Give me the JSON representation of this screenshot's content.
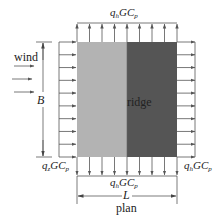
{
  "figure": {
    "type": "diagram",
    "title": "plan",
    "colors": {
      "windward_half": "#b3b3b3",
      "leeward_half": "#555555",
      "arrows": "#555555",
      "text": "#222222"
    },
    "labels": {
      "wind": "wind",
      "ridge": "ridge",
      "B": "B",
      "L": "L",
      "plan": "plan",
      "top_pressure": {
        "q": "q",
        "sub": "h",
        "rest": "GC",
        "rest_sub": "p"
      },
      "windward_pressure": {
        "q": "q",
        "sub": "z",
        "rest": "GC",
        "rest_sub": "p"
      },
      "leeward_pressure": {
        "q": "q",
        "sub": "h",
        "rest": "GC",
        "rest_sub": "p"
      },
      "bottom_pressure": {
        "q": "q",
        "sub": "h",
        "rest": "GC",
        "rest_sub": "p"
      }
    },
    "arrow_counts": {
      "top": 9,
      "bottom": 9,
      "left": 10,
      "right": 10,
      "wind": 3
    }
  }
}
